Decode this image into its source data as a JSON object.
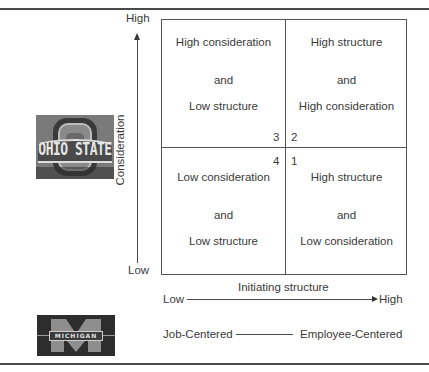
{
  "figure": {
    "y_axis": {
      "label": "Consideration",
      "high": "High",
      "low": "Low"
    },
    "x_axis": {
      "label": "Initiating structure",
      "low": "Low",
      "high": "High"
    },
    "quadrants": [
      {
        "position": "top-left",
        "number": "3",
        "lines": [
          "High consideration",
          "and",
          "Low structure"
        ]
      },
      {
        "position": "top-right",
        "number": "2",
        "lines": [
          "High structure",
          "and",
          "High consideration"
        ]
      },
      {
        "position": "bottom-left",
        "number": "4",
        "lines": [
          "Low consideration",
          "and",
          "Low structure"
        ]
      },
      {
        "position": "bottom-right",
        "number": "1",
        "lines": [
          "High structure",
          "and",
          "Low consideration"
        ]
      }
    ],
    "michigan_scale": {
      "left": "Job-Centered",
      "right": "Employee-Centered"
    },
    "logos": {
      "ohio_state": {
        "text": "OHIO STATE",
        "icon": "ohio-state-logo"
      },
      "michigan": {
        "text": "MICHIGAN",
        "icon": "michigan-logo"
      }
    },
    "colors": {
      "rule": "#4a4a4a",
      "text": "#3a3a3a",
      "grid": "#555555"
    }
  }
}
